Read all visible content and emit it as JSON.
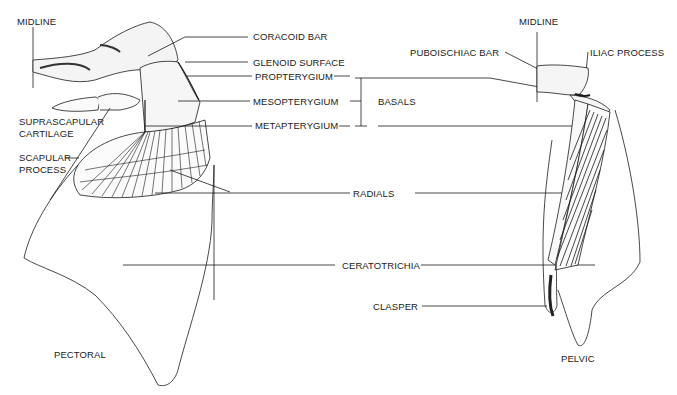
{
  "figure": {
    "type": "anatomical diagram",
    "colors": {
      "ink": "#1a1a1a",
      "background": "#ffffff",
      "shade": "#555555"
    }
  },
  "pectoral": {
    "title": "PECTORAL",
    "labels": {
      "midline": "MIDLINE",
      "coracoid_bar": "CORACOID BAR",
      "glenoid_surface": "GLENOID SURFACE",
      "suprascapular_1": "SUPRASCAPULAR",
      "suprascapular_2": "CARTILAGE",
      "scapular_1": "SCAPULAR",
      "scapular_2": "PROCESS"
    }
  },
  "shared_labels": {
    "propterygium": "PROPTERYGIUM",
    "mesopterygium": "MESOPTERYGIUM",
    "metapterygium": "METAPTERYGIUM",
    "basals": "BASALS",
    "radials": "RADIALS",
    "ceratotrichia": "CERATOTRICHIA"
  },
  "pelvic": {
    "title": "PELVIC",
    "labels": {
      "midline": "MIDLINE",
      "puboischiac_bar": "PUBOISCHIAC BAR",
      "iliac_process": "ILIAC PROCESS",
      "clasper": "CLASPER"
    }
  }
}
